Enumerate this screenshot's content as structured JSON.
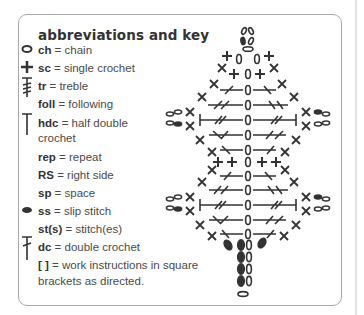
{
  "title": "abbreviations and key",
  "key": [
    {
      "icon": "chain-oval-icon",
      "abbr": "ch",
      "sep": " = ",
      "meaning": "chain"
    },
    {
      "icon": "single-crochet-plus-icon",
      "abbr": "sc",
      "sep": " = ",
      "meaning": "single crochet"
    },
    {
      "icon": "treble-icon",
      "abbr": "tr",
      "sep": " = ",
      "meaning": "treble"
    },
    {
      "icon": "",
      "abbr": "foll",
      "sep": " = ",
      "meaning": "following"
    },
    {
      "icon": "half-double-crochet-icon",
      "abbr": "hdc",
      "sep": " = ",
      "meaning": "half double",
      "meaning2": "crochet"
    },
    {
      "icon": "",
      "abbr": "rep",
      "sep": " = ",
      "meaning": "repeat"
    },
    {
      "icon": "",
      "abbr": "RS",
      "sep": " = ",
      "meaning": "right side"
    },
    {
      "icon": "",
      "abbr": "sp",
      "sep": " = ",
      "meaning": "space"
    },
    {
      "icon": "slip-stitch-icon",
      "abbr": "ss",
      "sep": " = ",
      "meaning": "slip stitch"
    },
    {
      "icon": "",
      "abbr": "st(s)",
      "sep": " = ",
      "meaning": "stitch(es)"
    },
    {
      "icon": "double-crochet-icon",
      "abbr": "dc",
      "sep": " = ",
      "meaning": "double crochet"
    },
    {
      "icon": "",
      "abbr": "[ ]",
      "sep": " = ",
      "meaning": "work instructions in square",
      "meaning2": "brackets as directed."
    }
  ],
  "diagram": {
    "label": "crochet stitch chart",
    "color": "#333333"
  },
  "colors": {
    "border": "#a9a9a9",
    "text": "#4a4a4a",
    "ink": "#333333"
  }
}
